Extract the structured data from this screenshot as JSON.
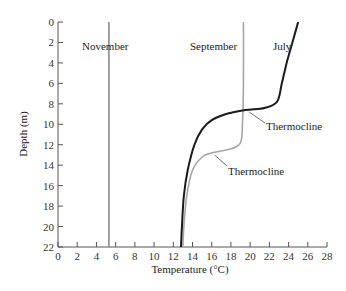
{
  "chart_data": {
    "type": "line",
    "title": "",
    "xlabel": "Temperature (°C)",
    "ylabel": "Depth (m)",
    "xlim": [
      0,
      28
    ],
    "ylim": [
      22,
      0
    ],
    "y_inverted": true,
    "grid": false,
    "x_ticks": [
      0,
      2,
      4,
      6,
      8,
      10,
      12,
      14,
      16,
      18,
      20,
      22,
      24,
      26,
      28
    ],
    "y_ticks": [
      0,
      2,
      4,
      6,
      8,
      10,
      12,
      14,
      16,
      18,
      20,
      22
    ],
    "series": [
      {
        "name": "November",
        "color": "#8a8a8a",
        "points": [
          [
            5.3,
            0
          ],
          [
            5.3,
            22
          ]
        ]
      },
      {
        "name": "September",
        "color": "#a6a6a6",
        "points": [
          [
            19.3,
            0
          ],
          [
            19.3,
            6
          ],
          [
            19.2,
            10
          ],
          [
            19.0,
            11.8
          ],
          [
            18.0,
            12.4
          ],
          [
            16.0,
            12.8
          ],
          [
            15.0,
            13.2
          ],
          [
            14.0,
            14.5
          ],
          [
            13.4,
            17
          ],
          [
            13.1,
            20
          ],
          [
            13.0,
            22
          ]
        ]
      },
      {
        "name": "July",
        "color": "#1a1a1a",
        "points": [
          [
            25.0,
            0
          ],
          [
            24.4,
            2
          ],
          [
            23.8,
            4
          ],
          [
            23.3,
            6
          ],
          [
            22.8,
            7.8
          ],
          [
            21.5,
            8.4
          ],
          [
            19.5,
            8.6
          ],
          [
            17.5,
            9.0
          ],
          [
            16.0,
            9.6
          ],
          [
            15.0,
            10.5
          ],
          [
            14.2,
            12
          ],
          [
            13.5,
            14.5
          ],
          [
            13.1,
            17
          ],
          [
            12.9,
            20
          ],
          [
            12.8,
            22
          ]
        ]
      }
    ],
    "annotations": [
      {
        "text": "Thermocline",
        "target_series": "July",
        "at": [
          19.5,
          8.6
        ]
      },
      {
        "text": "Thermocline",
        "target_series": "September",
        "at": [
          16.0,
          12.8
        ]
      }
    ]
  },
  "labels": {
    "november": "November",
    "september": "September",
    "july": "July",
    "thermocline_july": "Thermocline",
    "thermocline_september": "Thermocline",
    "xlabel": "Temperature (°C)",
    "ylabel": "Depth (m)"
  },
  "x_tick_labels": [
    "0",
    "2",
    "4",
    "6",
    "8",
    "10",
    "12",
    "14",
    "16",
    "18",
    "20",
    "22",
    "24",
    "26",
    "28"
  ],
  "y_tick_labels": [
    "0",
    "2",
    "4",
    "6",
    "8",
    "10",
    "12",
    "14",
    "16",
    "18",
    "20",
    "22"
  ]
}
